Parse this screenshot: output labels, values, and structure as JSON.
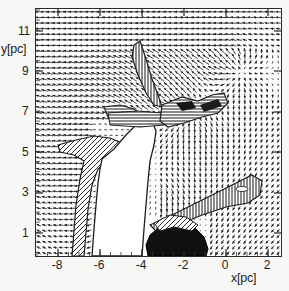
{
  "figure": {
    "background_color": "#f7f7f5",
    "frame_color": "#2a2a2a",
    "plot_background": "#fdfdfc"
  },
  "axes": {
    "x_title": "x[pc]",
    "y_title": "y[pc]",
    "x_ticks": [
      "-8",
      "-6",
      "-4",
      "-2",
      "0",
      "2"
    ],
    "y_ticks": [
      "11",
      "9",
      "7",
      "5",
      "3",
      "1"
    ]
  },
  "chart_data": {
    "type": "scatter",
    "title": "",
    "subtitle": "",
    "xlabel": "x[pc]",
    "ylabel": "y[pc]",
    "xlim": [
      -9.1,
      2.6
    ],
    "ylim": [
      0.1,
      11.9
    ],
    "x_tick_values": [
      -8,
      -6,
      -4,
      -2,
      0,
      2
    ],
    "y_tick_values": [
      11,
      9,
      7,
      5,
      3,
      1
    ],
    "grid": false,
    "legend_position": "none",
    "plot_kind": "vector-field-with-density-contours",
    "vector_field": {
      "glyph": "arrow",
      "nx": 44,
      "ny": 44,
      "color": "#262626",
      "note": "arrow length proportional to local speed; flow is predominantly leftward/horizontal across the top and right of the domain, becoming vertical and convergent toward the central cavity"
    },
    "shaded_regions": [
      {
        "name": "central-cavity",
        "fill": "white",
        "approx_center_xy": [
          -4.2,
          3.5
        ]
      },
      {
        "name": "dense-core-dark",
        "fill": "#121212",
        "approx_center_xy": [
          -2.4,
          0.8
        ]
      },
      {
        "name": "filament-branch-left",
        "fill": "hatched",
        "approx_center_xy": [
          -6.3,
          4.0
        ]
      },
      {
        "name": "spike-upper",
        "fill": "hatched",
        "approx_center_xy": [
          -4.3,
          8.3
        ]
      },
      {
        "name": "ridge-right",
        "fill": "hatched",
        "approx_center_xy": [
          -2.3,
          6.6
        ]
      },
      {
        "name": "wedge-lower-right",
        "fill": "hatched",
        "approx_center_xy": [
          0.5,
          3.0
        ]
      }
    ]
  }
}
